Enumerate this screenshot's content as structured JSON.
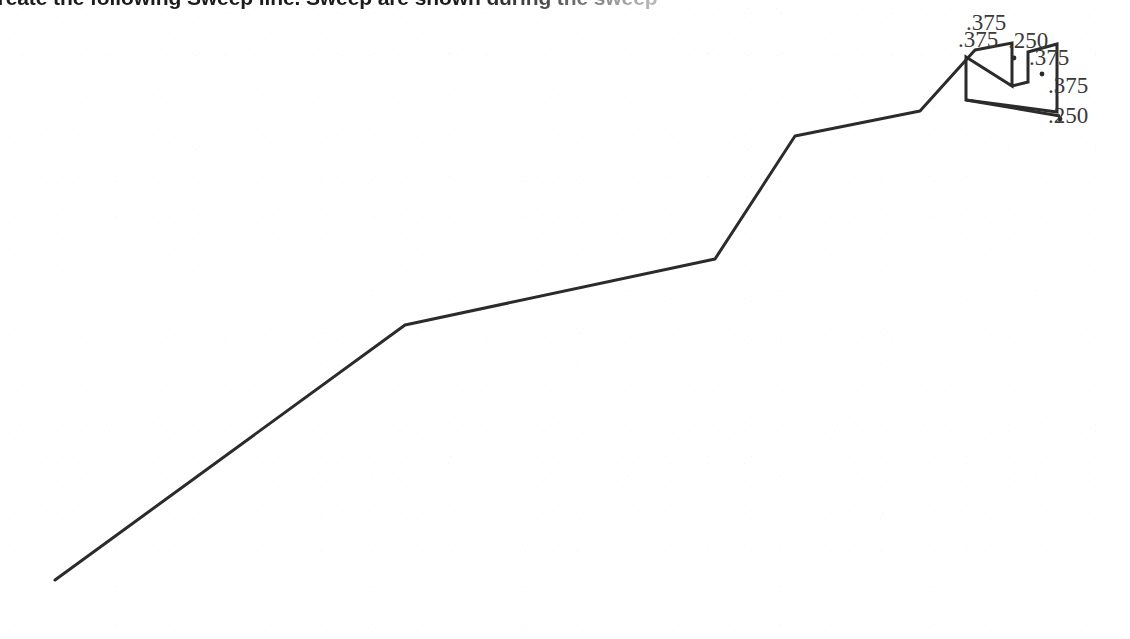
{
  "page": {
    "width": 1130,
    "height": 639,
    "background_color": "#ffffff",
    "media": "scanned-fax-page-fragment"
  },
  "heading": {
    "text": "create the following Sweep line. Sweep are shown during the sweep",
    "note_clipped_top": "true",
    "color": "#1c1c1c"
  },
  "chart_data": {
    "type": "line",
    "title": "create the following Sweep line. Sweep are shown during the sweep",
    "xlabel": "",
    "ylabel": "",
    "grid": "off",
    "legend": "none",
    "xlim": [
      0,
      1130
    ],
    "ylim": [
      0,
      639
    ],
    "note": "Coordinates are read directly in image pixel space; y increases downward in the source scan.",
    "series": [
      {
        "name": "sweep-line-profile",
        "color": "#2b2b2b",
        "line_width": 3,
        "points": [
          {
            "x": 55,
            "y": 580
          },
          {
            "x": 405,
            "y": 325
          },
          {
            "x": 715,
            "y": 259
          },
          {
            "x": 795,
            "y": 136
          },
          {
            "x": 920,
            "y": 111
          },
          {
            "x": 975,
            "y": 50
          }
        ]
      },
      {
        "name": "sweep-detail-zigzag",
        "color": "#2b2b2b",
        "line_width": 3,
        "points": [
          {
            "x": 975,
            "y": 50
          },
          {
            "x": 1012,
            "y": 43
          },
          {
            "x": 1012,
            "y": 86
          },
          {
            "x": 966,
            "y": 57
          },
          {
            "x": 966,
            "y": 100
          },
          {
            "x": 1057,
            "y": 112
          },
          {
            "x": 1057,
            "y": 44
          },
          {
            "x": 1028,
            "y": 52
          },
          {
            "x": 1028,
            "y": 82
          },
          {
            "x": 1012,
            "y": 86
          }
        ]
      },
      {
        "name": "sweep-detail-tail",
        "color": "#2b2b2b",
        "line_width": 3,
        "points": [
          {
            "x": 966,
            "y": 100
          },
          {
            "x": 1060,
            "y": 116
          }
        ]
      }
    ],
    "annotations": [
      {
        "id": "a1",
        "label": ".375",
        "x": 986,
        "y": 30,
        "anchor": "middle"
      },
      {
        "id": "a2",
        "label": ".375",
        "x": 958,
        "y": 47,
        "anchor": "start"
      },
      {
        "id": "a3",
        "label": ".250",
        "x": 1008,
        "y": 48,
        "anchor": "start"
      },
      {
        "id": "a4",
        "label": ".375",
        "x": 1029,
        "y": 65,
        "anchor": "start"
      },
      {
        "id": "a5",
        "label": ".375",
        "x": 1048,
        "y": 93,
        "anchor": "start"
      },
      {
        "id": "a6",
        "label": ".250",
        "x": 1048,
        "y": 123,
        "anchor": "start"
      }
    ],
    "markers": [
      {
        "id": "m1",
        "x": 1014,
        "y": 58
      },
      {
        "id": "m2",
        "x": 1042,
        "y": 74
      },
      {
        "id": "m3",
        "x": 1060,
        "y": 119
      }
    ]
  }
}
